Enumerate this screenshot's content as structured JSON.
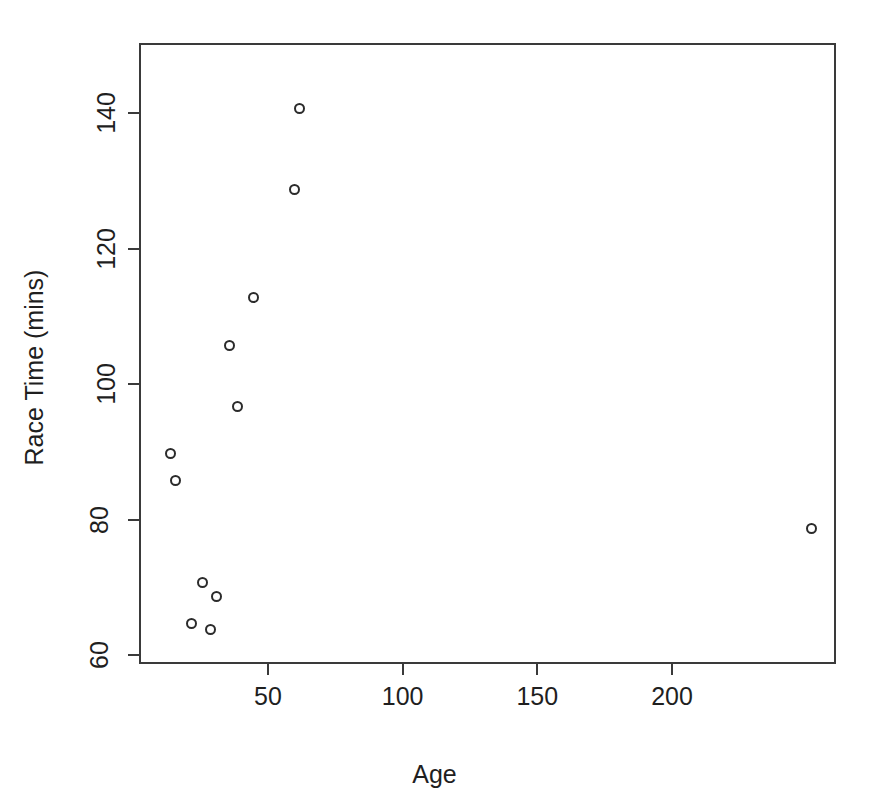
{
  "chart_data": {
    "type": "scatter",
    "title": "Race Time (mins) vs Age [scatterplot]",
    "xlabel": "Age",
    "ylabel": "Race Time (mins)",
    "xlim": [
      2,
      260
    ],
    "ylim": [
      54,
      146
    ],
    "grid": false,
    "legend": null,
    "point_style": "open-circle",
    "xticks": [
      50,
      100,
      150,
      200
    ],
    "xtick_labels": [
      "50",
      "100",
      "150",
      "200"
    ],
    "yticks": [
      60,
      80,
      100,
      120,
      140
    ],
    "ytick_labels": [
      "60",
      "80",
      "100",
      "120",
      "140"
    ],
    "x": [
      61,
      59,
      44,
      38,
      35,
      13,
      15,
      25,
      30,
      21,
      28,
      251
    ],
    "y": [
      141,
      129,
      113,
      97,
      106,
      90,
      86,
      71,
      69,
      65,
      64,
      79
    ],
    "points": [
      {
        "age": 61,
        "race_time": 141
      },
      {
        "age": 59,
        "race_time": 129
      },
      {
        "age": 44,
        "race_time": 113
      },
      {
        "age": 38,
        "race_time": 97
      },
      {
        "age": 35,
        "race_time": 106
      },
      {
        "age": 13,
        "race_time": 90
      },
      {
        "age": 15,
        "race_time": 86
      },
      {
        "age": 25,
        "race_time": 71
      },
      {
        "age": 30,
        "race_time": 69
      },
      {
        "age": 21,
        "race_time": 65
      },
      {
        "age": 28,
        "race_time": 64
      },
      {
        "age": 251,
        "race_time": 79
      }
    ],
    "colors": {
      "point_stroke": "#2b2b2b",
      "axis": "#3a3a3a",
      "text": "#1f1f1f",
      "background": "#ffffff"
    }
  }
}
